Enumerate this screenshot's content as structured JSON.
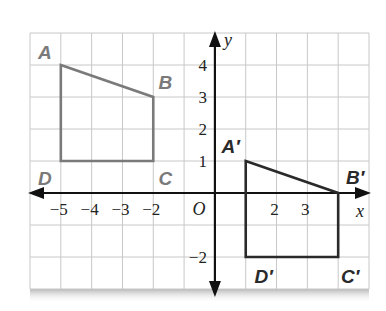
{
  "diagram": {
    "type": "coordinate-plane-translation",
    "grid": {
      "x_min": -6,
      "x_max": 5,
      "y_min": -3,
      "y_max": 5,
      "color": "#c8c8c8"
    },
    "axes": {
      "x_label": "x",
      "y_label": "y",
      "origin_label": "O",
      "x_ticks": [
        {
          "value": -5,
          "label": "−5"
        },
        {
          "value": -4,
          "label": "−4"
        },
        {
          "value": -3,
          "label": "−3"
        },
        {
          "value": -2,
          "label": "−2"
        },
        {
          "value": 2,
          "label": "2"
        },
        {
          "value": 3,
          "label": "3"
        }
      ],
      "y_ticks": [
        {
          "value": 4,
          "label": "4"
        },
        {
          "value": 3,
          "label": "3"
        },
        {
          "value": 2,
          "label": "2"
        },
        {
          "value": 1,
          "label": "1"
        },
        {
          "value": -2,
          "label": "−2"
        }
      ],
      "color": "#111111"
    },
    "figures": [
      {
        "name": "ABCD",
        "color": "#7a7a7a",
        "vertices": [
          {
            "label": "A",
            "x": -5,
            "y": 4
          },
          {
            "label": "B",
            "x": -2,
            "y": 3
          },
          {
            "label": "C",
            "x": -2,
            "y": 1
          },
          {
            "label": "D",
            "x": -5,
            "y": 1
          }
        ]
      },
      {
        "name": "A'B'C'D'",
        "color": "#2a2a2a",
        "vertices": [
          {
            "label": "A′",
            "x": 1,
            "y": 1
          },
          {
            "label": "B′",
            "x": 4,
            "y": 0
          },
          {
            "label": "C′",
            "x": 4,
            "y": -2
          },
          {
            "label": "D′",
            "x": 1,
            "y": -2
          }
        ]
      }
    ]
  }
}
